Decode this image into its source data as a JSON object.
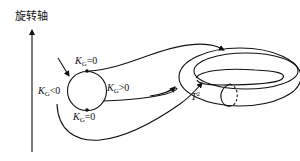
{
  "figure": {
    "axis_label": "旋转轴",
    "circle_labels": {
      "top": {
        "symbol": "K",
        "subscript": "G",
        "relation": "=0"
      },
      "right": {
        "symbol": "K",
        "subscript": "G",
        "relation": ">0"
      },
      "left": {
        "symbol": "K",
        "subscript": "G",
        "relation": "<0"
      },
      "bottom": {
        "symbol": "K",
        "subscript": "G",
        "relation": "=0"
      }
    },
    "torus_label": {
      "symbol": "T",
      "superscript": "2"
    },
    "colors": {
      "stroke": "#111111",
      "background": "#ffffff"
    }
  }
}
